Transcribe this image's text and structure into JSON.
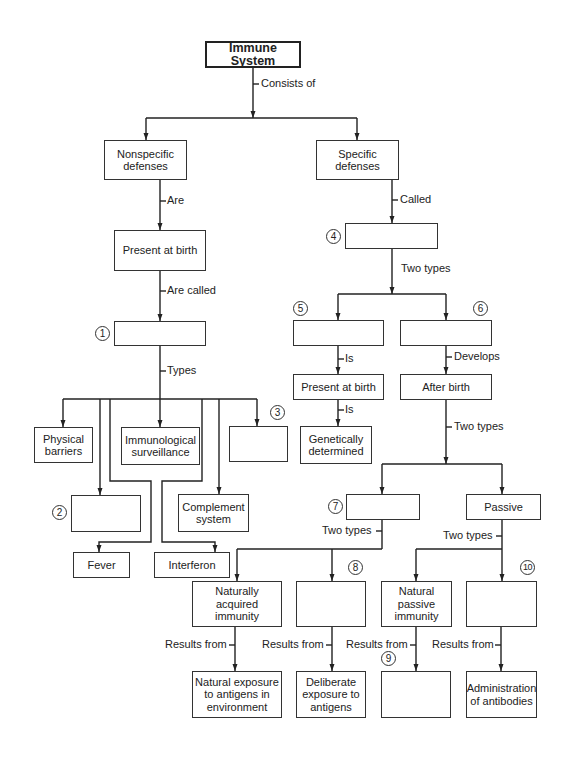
{
  "title": "Immune System",
  "nodes": {
    "root": "Immune System",
    "nonspecific": "Nonspecific defenses",
    "specific": "Specific defenses",
    "present_left": "Present at birth",
    "blank1": "",
    "physical": "Physical barriers",
    "immuno": "Immunological surveillance",
    "blank3": "",
    "blank2": "",
    "complement": "Complement system",
    "fever": "Fever",
    "interferon": "Interferon",
    "blank4": "",
    "blank5": "",
    "blank6": "",
    "present_right": "Present at birth",
    "after_birth": "After birth",
    "genetic": "Genetically determined",
    "blank7": "",
    "passive": "Passive",
    "naturally_acquired": "Naturally acquired immunity",
    "blank8": "",
    "natural_passive": "Natural passive immunity",
    "blank10": "",
    "natural_exposure": "Natural exposure to antigens in environment",
    "deliberate": "Deliberate exposure to antigens",
    "blank9": "",
    "administration": "Administration of antibodies"
  },
  "edge_labels": {
    "consists_of": "Consists of",
    "are": "Are",
    "are_called": "Are called",
    "types": "Types",
    "called": "Called",
    "two_types_4": "Two types",
    "is_5": "Is",
    "develops": "Develops",
    "is_birth": "Is",
    "two_types_after": "Two types",
    "two_types_7": "Two types",
    "two_types_passive": "Two types",
    "results_from_1": "Results from",
    "results_from_2": "Results from",
    "results_from_3": "Results from",
    "results_from_4": "Results from"
  },
  "numbers": {
    "n1": "1",
    "n2": "2",
    "n3": "3",
    "n4": "4",
    "n5": "5",
    "n6": "6",
    "n7": "7",
    "n8": "8",
    "n9": "9",
    "n10": "10"
  }
}
